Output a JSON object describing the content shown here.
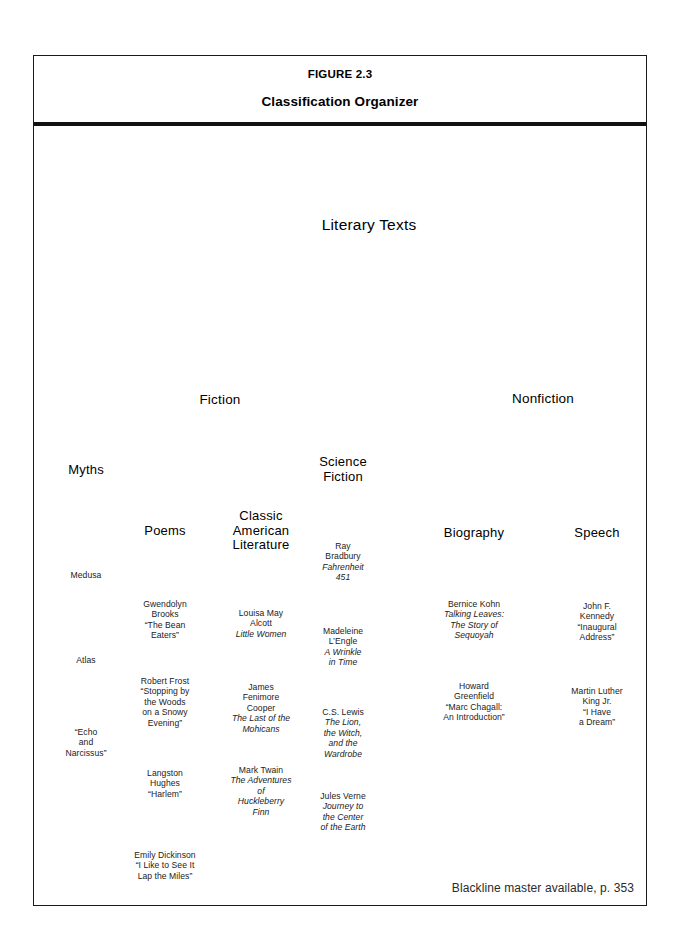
{
  "figure": {
    "number": "FIGURE 2.3",
    "title": "Classification Organizer",
    "footer": "Blackline master available, p. 353"
  },
  "diagram": {
    "type": "classification-tree",
    "root": "Literary Texts",
    "nodes": {
      "root": {
        "label": "Literary Texts",
        "cx": 369,
        "cy": 225,
        "r": 82
      },
      "fiction": {
        "label": "Fiction",
        "cx": 220,
        "cy": 400,
        "r": 60
      },
      "nonfiction": {
        "label": "Nonfiction",
        "cx": 543,
        "cy": 399,
        "r": 60
      },
      "myths": {
        "label": "Myths",
        "cx": 86,
        "cy": 470,
        "r": 42
      },
      "poems": {
        "label": "Poems",
        "cx": 165,
        "cy": 531,
        "r": 43
      },
      "classic": {
        "label": "Classic American Literature",
        "cx": 261,
        "cy": 531,
        "r": 45
      },
      "scifi": {
        "label": "Science Fiction",
        "cx": 343,
        "cy": 470,
        "r": 42
      },
      "biography": {
        "label": "Biography",
        "cx": 474,
        "cy": 533,
        "r": 41
      },
      "speech": {
        "label": "Speech",
        "cx": 597,
        "cy": 533,
        "r": 41
      },
      "medusa": {
        "label": "Medusa",
        "cx": 86,
        "cy": 575,
        "r": 33
      },
      "atlas": {
        "label": "Atlas",
        "cx": 86,
        "cy": 660,
        "r": 33
      },
      "echo": {
        "label": "\"Echo and Narcissus\"",
        "cx": 86,
        "cy": 743,
        "r": 34
      },
      "brooks": {
        "label": "Gwendolyn Brooks \"The Bean Eaters\"",
        "cx": 165,
        "cy": 620,
        "r": 33
      },
      "frost": {
        "label": "Robert Frost \"Stopping by the Woods on a Snowy Evening\"",
        "cx": 165,
        "cy": 702,
        "r": 36
      },
      "hughes": {
        "label": "Langston Hughes \"Harlem\"",
        "cx": 165,
        "cy": 784,
        "r": 33
      },
      "dickinson": {
        "label": "Emily Dickinson \"I Like to See It Lap the Miles\"",
        "cx": 165,
        "cy": 866,
        "r": 36
      },
      "alcott": {
        "label": "Louisa May Alcott Little Women",
        "cx": 261,
        "cy": 624,
        "r": 34
      },
      "cooper": {
        "label": "James Fenimore Cooper The Last of the Mohicans",
        "cx": 261,
        "cy": 708,
        "r": 37
      },
      "twain": {
        "label": "Mark Twain The Adventures of Huckleberry Finn",
        "cx": 261,
        "cy": 791,
        "r": 37
      },
      "bradbury": {
        "label": "Ray Bradbury Fahrenheit 451",
        "cx": 343,
        "cy": 562,
        "r": 34
      },
      "lengle": {
        "label": "Madeleine L'Engle A Wrinkle in Time",
        "cx": 343,
        "cy": 647,
        "r": 34
      },
      "lewis": {
        "label": "C.S. Lewis The Lion, the Witch, and the Wardrobe",
        "cx": 343,
        "cy": 733,
        "r": 36
      },
      "verne": {
        "label": "Jules Verne Journey to the Center of the Earth",
        "cx": 343,
        "cy": 812,
        "r": 36
      },
      "kohn": {
        "label": "Bernice Kohn Talking Leaves: The Story of Sequoyah",
        "cx": 474,
        "cy": 620,
        "r": 36
      },
      "greenfield": {
        "label": "Howard Greenfield \"Marc Chagall: An Introduction\"",
        "cx": 474,
        "cy": 702,
        "r": 36
      },
      "jfk": {
        "label": "John F. Kennedy \"Inaugural Address\"",
        "cx": 597,
        "cy": 622,
        "r": 36
      },
      "mlk": {
        "label": "Martin Luther King Jr. \"I Have a Dream\"",
        "cx": 597,
        "cy": 707,
        "r": 36
      }
    },
    "node_text": {
      "root": [
        {
          "t": "Literary Texts",
          "i": false
        }
      ],
      "fiction": [
        {
          "t": "Fiction",
          "i": false
        }
      ],
      "nonfiction": [
        {
          "t": "Nonfiction",
          "i": false
        }
      ],
      "myths": [
        {
          "t": "Myths",
          "i": false
        }
      ],
      "poems": [
        {
          "t": "Poems",
          "i": false
        }
      ],
      "classic": [
        {
          "t": "Classic",
          "i": false
        },
        {
          "t": "American",
          "i": false
        },
        {
          "t": "Literature",
          "i": false
        }
      ],
      "scifi": [
        {
          "t": "Science",
          "i": false
        },
        {
          "t": "Fiction",
          "i": false
        }
      ],
      "biography": [
        {
          "t": "Biography",
          "i": false
        }
      ],
      "speech": [
        {
          "t": "Speech",
          "i": false
        }
      ],
      "medusa": [
        {
          "t": "Medusa",
          "i": false
        }
      ],
      "atlas": [
        {
          "t": "Atlas",
          "i": false
        }
      ],
      "echo": [
        {
          "t": "“Echo",
          "i": false
        },
        {
          "t": "and",
          "i": false
        },
        {
          "t": "Narcissus”",
          "i": false
        }
      ],
      "brooks": [
        {
          "t": "Gwendolyn",
          "i": false
        },
        {
          "t": "Brooks",
          "i": false
        },
        {
          "t": "“The Bean",
          "i": false
        },
        {
          "t": "Eaters”",
          "i": false
        }
      ],
      "frost": [
        {
          "t": "Robert Frost",
          "i": false
        },
        {
          "t": "“Stopping by",
          "i": false
        },
        {
          "t": "the Woods",
          "i": false
        },
        {
          "t": "on a Snowy",
          "i": false
        },
        {
          "t": "Evening”",
          "i": false
        }
      ],
      "hughes": [
        {
          "t": "Langston",
          "i": false
        },
        {
          "t": "Hughes",
          "i": false
        },
        {
          "t": "“Harlem”",
          "i": false
        }
      ],
      "dickinson": [
        {
          "t": "Emily Dickinson",
          "i": false
        },
        {
          "t": "“I Like to See It",
          "i": false
        },
        {
          "t": "Lap the Miles”",
          "i": false
        }
      ],
      "alcott": [
        {
          "t": "Louisa May",
          "i": false
        },
        {
          "t": "Alcott",
          "i": false
        },
        {
          "t": "Little Women",
          "i": true
        }
      ],
      "cooper": [
        {
          "t": "James",
          "i": false
        },
        {
          "t": "Fenimore",
          "i": false
        },
        {
          "t": "Cooper",
          "i": false
        },
        {
          "t": "The Last of the",
          "i": true
        },
        {
          "t": "Mohicans",
          "i": true
        }
      ],
      "twain": [
        {
          "t": "Mark Twain",
          "i": false
        },
        {
          "t": "The Adventures",
          "i": true
        },
        {
          "t": "of",
          "i": true
        },
        {
          "t": "Huckleberry",
          "i": true
        },
        {
          "t": "Finn",
          "i": true
        }
      ],
      "bradbury": [
        {
          "t": "Ray",
          "i": false
        },
        {
          "t": "Bradbury",
          "i": false
        },
        {
          "t": "Fahrenheit",
          "i": true
        },
        {
          "t": "451",
          "i": true
        }
      ],
      "lengle": [
        {
          "t": "Madeleine",
          "i": false
        },
        {
          "t": "L’Engle",
          "i": false
        },
        {
          "t": "A Wrinkle",
          "i": true
        },
        {
          "t": "in Time",
          "i": true
        }
      ],
      "lewis": [
        {
          "t": "C.S. Lewis",
          "i": false
        },
        {
          "t": "The Lion,",
          "i": true
        },
        {
          "t": "the Witch,",
          "i": true
        },
        {
          "t": "and the",
          "i": true
        },
        {
          "t": "Wardrobe",
          "i": true
        }
      ],
      "verne": [
        {
          "t": "Jules Verne",
          "i": false
        },
        {
          "t": "Journey to",
          "i": true
        },
        {
          "t": "the Center",
          "i": true
        },
        {
          "t": "of the Earth",
          "i": true
        }
      ],
      "kohn": [
        {
          "t": "Bernice Kohn",
          "i": false
        },
        {
          "t": "Talking Leaves:",
          "i": true
        },
        {
          "t": "The Story of",
          "i": true
        },
        {
          "t": "Sequoyah",
          "i": true
        }
      ],
      "greenfield": [
        {
          "t": "Howard",
          "i": false
        },
        {
          "t": "Greenfield",
          "i": false
        },
        {
          "t": "“Marc Chagall:",
          "i": false
        },
        {
          "t": "An Introduction”",
          "i": false
        }
      ],
      "jfk": [
        {
          "t": "John F.",
          "i": false
        },
        {
          "t": "Kennedy",
          "i": false
        },
        {
          "t": "“Inaugural",
          "i": false
        },
        {
          "t": "Address”",
          "i": false
        }
      ],
      "mlk": [
        {
          "t": "Martin Luther",
          "i": false
        },
        {
          "t": "King Jr.",
          "i": false
        },
        {
          "t": "“I Have",
          "i": false
        },
        {
          "t": "a Dream”",
          "i": false
        }
      ]
    },
    "node_class": {
      "root": "lvl0",
      "fiction": "lvl1",
      "nonfiction": "lvl1",
      "myths": "lvl2",
      "poems": "lvl2",
      "classic": "lvl2",
      "scifi": "lvl2",
      "biography": "lvl2",
      "speech": "lvl2",
      "medusa": "leaf",
      "atlas": "leaf",
      "echo": "leaf",
      "brooks": "leaf",
      "frost": "leaf",
      "hughes": "leaf",
      "dickinson": "leaf",
      "alcott": "leaf",
      "cooper": "leaf",
      "twain": "leaf",
      "bradbury": "leaf",
      "lengle": "leaf",
      "lewis": "leaf",
      "verne": "leaf",
      "kohn": "leaf",
      "greenfield": "leaf",
      "jfk": "leaf",
      "mlk": "leaf"
    },
    "edges": [
      [
        "root",
        "fiction"
      ],
      [
        "root",
        "nonfiction"
      ],
      [
        "fiction",
        "myths"
      ],
      [
        "fiction",
        "poems"
      ],
      [
        "fiction",
        "classic"
      ],
      [
        "fiction",
        "scifi"
      ],
      [
        "nonfiction",
        "biography"
      ],
      [
        "nonfiction",
        "speech"
      ],
      [
        "myths",
        "medusa"
      ],
      [
        "medusa",
        "atlas"
      ],
      [
        "atlas",
        "echo"
      ],
      [
        "poems",
        "brooks"
      ],
      [
        "brooks",
        "frost"
      ],
      [
        "frost",
        "hughes"
      ],
      [
        "hughes",
        "dickinson"
      ],
      [
        "classic",
        "alcott"
      ],
      [
        "alcott",
        "cooper"
      ],
      [
        "cooper",
        "twain"
      ],
      [
        "scifi",
        "bradbury"
      ],
      [
        "bradbury",
        "lengle"
      ],
      [
        "lengle",
        "lewis"
      ],
      [
        "lewis",
        "verne"
      ],
      [
        "biography",
        "kohn"
      ],
      [
        "kohn",
        "greenfield"
      ],
      [
        "speech",
        "jfk"
      ],
      [
        "jfk",
        "mlk"
      ]
    ]
  }
}
